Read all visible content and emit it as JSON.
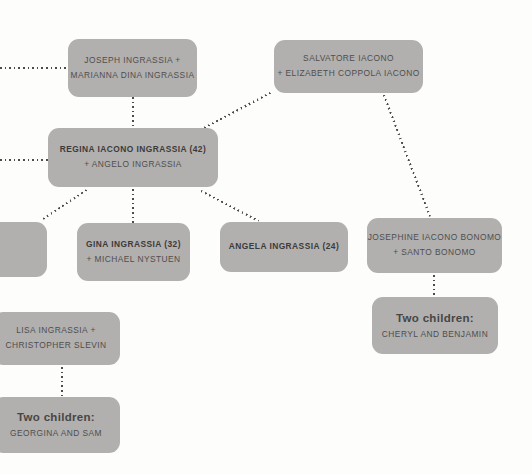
{
  "colors": {
    "node_background": "#b1b0af",
    "name_text": "#3c3b3a",
    "secondary_text": "#4f4e4d",
    "edge_dots": "#4c4b4a",
    "page_background": "#fdfdfc"
  },
  "nodes": {
    "joseph": {
      "line1": "JOSEPH INGRASSIA +",
      "line2": "MARIANNA DINA INGRASSIA"
    },
    "salvatore": {
      "line1": "SALVATORE IACONO",
      "line2": "+ ELIZABETH COPPOLA IACONO"
    },
    "regina": {
      "line1": "REGINA IACONO INGRASSIA (42)",
      "line2": "+ ANGELO INGRASSIA"
    },
    "gina": {
      "line1": "GINA INGRASSIA (32)",
      "line2": "+ MICHAEL NYSTUEN"
    },
    "angela": {
      "line1": "ANGELA INGRASSIA (24)"
    },
    "josephine": {
      "line1": "JOSEPHINE IACONO BONOMO",
      "line2": "+ SANTO BONOMO"
    },
    "cheryl_benjamin": {
      "line1": "Two children:",
      "line2": "CHERYL AND BENJAMIN"
    },
    "lisa": {
      "line1": "LISA INGRASSIA +",
      "line2": "CHRISTOPHER SLEVIN"
    },
    "georgina_sam": {
      "line1": "Two children:",
      "line2": "GEORGINA AND SAM"
    }
  }
}
